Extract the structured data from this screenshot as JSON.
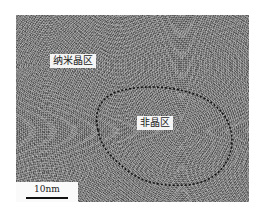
{
  "figure": {
    "type": "TEM micrograph",
    "labels": {
      "nanocrystalline_region": "纳米晶区",
      "amorphous_region": "非晶区"
    },
    "scale_bar": {
      "text": "10nm"
    },
    "outline_style": "black dashed line enclosing amorphous region"
  }
}
